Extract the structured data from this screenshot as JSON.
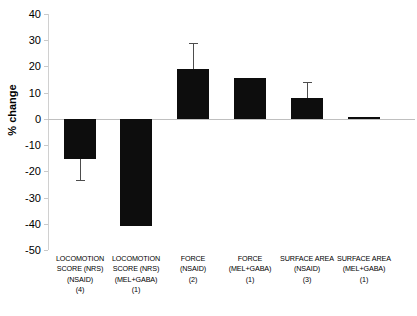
{
  "chart_data": {
    "type": "bar",
    "title": "",
    "xlabel": "",
    "ylabel": "% change",
    "ylim": [
      -50,
      40
    ],
    "ytick_step": 10,
    "grid": false,
    "legend": "none",
    "bar_color": "#0d0d0d",
    "categories": [
      "LOCOMOTION SCORE (NRS) (NSAID) (4)",
      "LOCOMOTION SCORE (NRS) (MEL+GABA) (1)",
      "FORCE (NSAID) (2)",
      "FORCE (MEL+GABA) (1)",
      "SURFACE AREA (NSAID) (3)",
      "SURFACE AREA (MEL+GABA) (1)"
    ],
    "category_lines": [
      [
        "LOCOMOTION",
        "SCORE (NRS)",
        "(NSAID)",
        "(4)"
      ],
      [
        "LOCOMOTION",
        "SCORE (NRS)",
        "(MEL+GABA)",
        "(1)"
      ],
      [
        "FORCE",
        "(NSAID)",
        "(2)"
      ],
      [
        "FORCE",
        "(MEL+GABA)",
        "(1)"
      ],
      [
        "SURFACE AREA",
        "(NSAID)",
        "(3)"
      ],
      [
        "SURFACE AREA",
        "(MEL+GABA)",
        "(1)"
      ]
    ],
    "values": [
      -15.2,
      -41.0,
      19.0,
      15.5,
      8.0,
      0.8
    ],
    "errors": [
      8.0,
      0,
      10.0,
      0,
      6.0,
      0
    ],
    "yticks": [
      40,
      30,
      20,
      10,
      0,
      -10,
      -20,
      -30,
      -40,
      -50
    ],
    "ytick_labels": [
      "40",
      "30",
      "20",
      "10",
      "0",
      "-10",
      "-20",
      "-30",
      "-40",
      "-50"
    ],
    "series": [
      {
        "name": "% change",
        "values": [
          -15.2,
          -41.0,
          19.0,
          15.5,
          8.0,
          0.8
        ],
        "errors": [
          8.0,
          0,
          10.0,
          0,
          6.0,
          0
        ]
      }
    ]
  }
}
